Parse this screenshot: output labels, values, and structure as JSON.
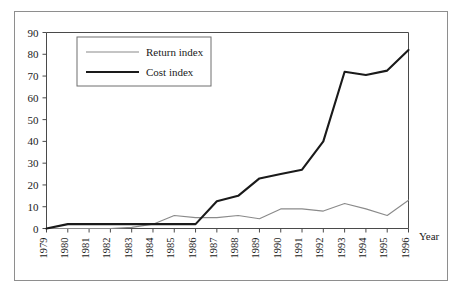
{
  "chart_data": {
    "type": "line",
    "title": "",
    "xlabel": "Year",
    "ylabel": "",
    "xlim": [
      1979,
      1996
    ],
    "ylim": [
      0,
      90
    ],
    "ytick_step": 10,
    "grid": false,
    "legend_position": "top-left",
    "x": [
      1979,
      1980,
      1981,
      1982,
      1983,
      1984,
      1985,
      1986,
      1987,
      1988,
      1989,
      1990,
      1991,
      1992,
      1993,
      1994,
      1995,
      1996
    ],
    "categories": [
      "1979",
      "1980",
      "1981",
      "1982",
      "1983",
      "1984",
      "1985",
      "1986",
      "1987",
      "1988",
      "1989",
      "1990",
      "1991",
      "1992",
      "1993",
      "1994",
      "1995",
      "1996"
    ],
    "yticks": [
      0,
      10,
      20,
      30,
      40,
      50,
      60,
      70,
      80,
      90
    ],
    "ytick_labels": [
      "0",
      "10",
      "20",
      "30",
      "40",
      "50",
      "60",
      "70",
      "80",
      "90"
    ],
    "series": [
      {
        "name": "Return index",
        "color": "#8a8a8a",
        "line_width": "thin",
        "values": [
          0,
          0,
          0,
          0,
          0.5,
          2,
          6,
          5,
          5,
          6,
          4.5,
          9,
          9,
          8,
          11.5,
          9,
          6,
          13
        ]
      },
      {
        "name": "Cost index",
        "color": "#1a1a1a",
        "line_width": "thick",
        "values": [
          0,
          2,
          2,
          2,
          2,
          2,
          2,
          2,
          12.5,
          15,
          23,
          25,
          27,
          40,
          72,
          70.5,
          72.5,
          82
        ]
      }
    ]
  },
  "legend": {
    "entries": [
      {
        "label": "Return index"
      },
      {
        "label": "Cost index"
      }
    ]
  },
  "axis": {
    "x_title": "Year"
  }
}
